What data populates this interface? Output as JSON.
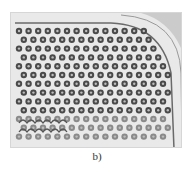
{
  "figure": {
    "caption": "b)",
    "colors": {
      "background": "#e9e9e9",
      "hole_ring": "#4a4a4a",
      "hole_center": "#bdbdbd",
      "boundary": "#6a6a6a"
    },
    "lattice": {
      "columns": 16,
      "rows": 13,
      "pitch_x": 9.6,
      "pitch_y": 8.8
    }
  }
}
